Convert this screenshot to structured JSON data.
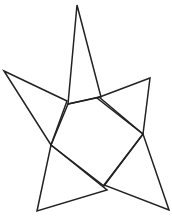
{
  "figure": {
    "width": 172,
    "height": 217,
    "background": "#ffffff",
    "stroke_color": "#222222",
    "stroke_width": 1.5,
    "shapes": [
      {
        "name": "top-triangle",
        "points": "77,5 68,104 101,97"
      },
      {
        "name": "left-triangle",
        "points": "4,71 67,101 51,145"
      },
      {
        "name": "right-triangle",
        "points": "150,78 97,98 143,134"
      },
      {
        "name": "bottom-right-triangle",
        "points": "169,210 143,134 104,185"
      },
      {
        "name": "bottom-left-triangle",
        "points": "37,211 51,145 107,190"
      },
      {
        "name": "center-pentagon",
        "points": "68,104 99,97 143,134 104,186 51,145"
      }
    ]
  }
}
